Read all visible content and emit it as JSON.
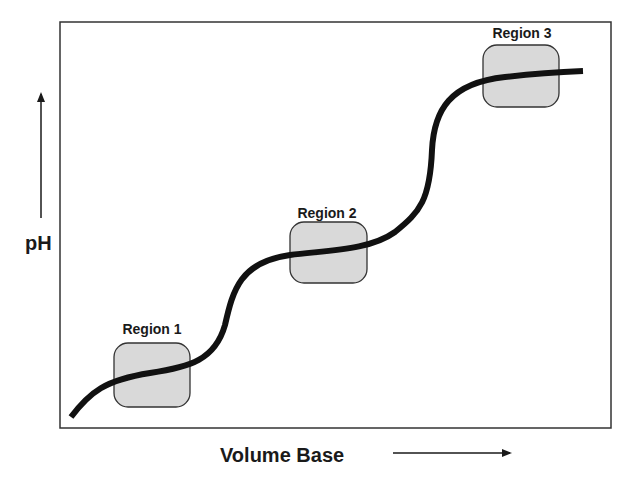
{
  "diagram": {
    "y_axis_label": "pH",
    "x_axis_label": "Volume Base",
    "regions": [
      {
        "label": "Region 1"
      },
      {
        "label": "Region 2"
      },
      {
        "label": "Region 3"
      }
    ],
    "colors": {
      "curve": "#111111",
      "region_fill": "#d9d9d9",
      "region_stroke": "#333333",
      "frame": "#333333"
    }
  }
}
